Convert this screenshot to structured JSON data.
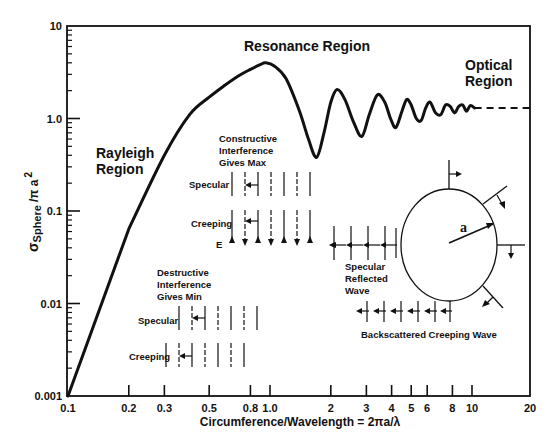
{
  "chart_data": {
    "type": "line",
    "title": "",
    "xlabel": "Circumference/Wavelength = 2πa/λ",
    "ylabel": "σ Sphere /πa²",
    "ylabel_parts": {
      "sigma": "σ",
      "sub": "Sphere",
      "denom": "/π a",
      "exp": "2"
    },
    "xscale": "log",
    "yscale": "log",
    "xlim": [
      0.1,
      20
    ],
    "ylim": [
      0.001,
      10
    ],
    "grid": false,
    "x_ticks": [
      "0.1",
      "0.2",
      "0.3",
      "0.5",
      "0.8",
      "1.0",
      "2",
      "3",
      "4",
      "5",
      "6",
      "8",
      "10",
      "20"
    ],
    "x_tick_values": [
      0.1,
      0.2,
      0.3,
      0.5,
      0.8,
      1.0,
      2,
      3,
      4,
      5,
      6,
      8,
      10,
      20
    ],
    "y_ticks": [
      "0.001",
      "0.01",
      "0.1",
      "1.0",
      "10"
    ],
    "y_tick_values": [
      0.001,
      0.01,
      0.1,
      1.0,
      10
    ],
    "series": [
      {
        "name": "Sphere radar cross section (normalized)",
        "style": "solid",
        "x": [
          0.1,
          0.2,
          0.3,
          0.4,
          0.5,
          0.6,
          0.7,
          0.8,
          0.9,
          0.95,
          1.05,
          1.2,
          1.4,
          1.55,
          1.7,
          1.85,
          2.0,
          2.15,
          2.35,
          2.6,
          2.85,
          3.1,
          3.4,
          3.7,
          3.95,
          4.2,
          4.5,
          4.75,
          5.0,
          5.3,
          5.6,
          5.9,
          6.2,
          6.6,
          7.0,
          7.4,
          7.8,
          8.2,
          8.6,
          9.0,
          9.4,
          9.8,
          10.3
        ],
        "y": [
          0.001,
          0.064,
          0.4,
          1.1,
          1.7,
          2.3,
          2.9,
          3.4,
          3.85,
          4.0,
          3.7,
          2.7,
          1.2,
          0.6,
          0.38,
          0.7,
          1.5,
          2.06,
          1.6,
          0.9,
          0.64,
          1.1,
          1.8,
          1.5,
          1.0,
          0.8,
          1.2,
          1.6,
          1.4,
          1.0,
          0.95,
          1.3,
          1.5,
          1.15,
          1.1,
          1.4,
          1.35,
          1.15,
          1.35,
          1.4,
          1.2,
          1.38,
          1.3
        ]
      },
      {
        "name": "Optical asymptote",
        "style": "dashed",
        "x": [
          10.3,
          20
        ],
        "y": [
          1.3,
          1.3
        ]
      }
    ],
    "annotations": [
      {
        "text": "Rayleigh Region",
        "x": 0.14,
        "y": 0.35
      },
      {
        "text": "Resonance Region",
        "x": 1.0,
        "y": 6.0
      },
      {
        "text": "Optical Region",
        "x": 12,
        "y": 2.5
      }
    ]
  },
  "labels": {
    "rayleigh": [
      "Rayleigh",
      "Region"
    ],
    "resonance": "Resonance Region",
    "optical": [
      "Optical",
      "Region"
    ],
    "constructive": [
      "Constructive",
      "Interference",
      "Gives  Max"
    ],
    "destructive": [
      "Destructive",
      "Interference",
      "Gives  Min"
    ],
    "specular": "Specular",
    "creeping": "Creeping",
    "e_field": "E",
    "specular_reflected": [
      "Specular",
      "Reflected",
      "Wave"
    ],
    "backscattered": "Backscattered Creeping Wave",
    "radius": "a"
  }
}
